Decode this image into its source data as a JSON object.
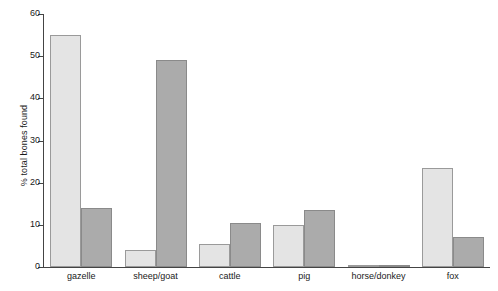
{
  "chart_data": {
    "type": "bar",
    "title": "",
    "xlabel": "",
    "ylabel": "% total bones found",
    "ylim": [
      0,
      60
    ],
    "yticks": [
      0,
      10,
      20,
      30,
      40,
      50,
      60
    ],
    "ytick_labels": [
      "0",
      "10",
      "20",
      "30",
      "40",
      "50",
      "60"
    ],
    "grid": false,
    "legend": "none",
    "categories": [
      "gazelle",
      "sheep/goat",
      "cattle",
      "pig",
      "horse/donkey",
      "fox"
    ],
    "series": [
      {
        "name": "light",
        "color": "#e4e4e4",
        "values": [
          55,
          4,
          5.5,
          10,
          0.5,
          23.5
        ]
      },
      {
        "name": "dark",
        "color": "#ababab",
        "values": [
          14,
          49,
          10.5,
          13.5,
          0.5,
          7
        ]
      }
    ]
  },
  "colors": {
    "background": "#ffffff",
    "axis": "#444444",
    "text": "#1a1a1a",
    "bar_light_fill": "#e4e4e4",
    "bar_light_edge": "#9a9a9a",
    "bar_dark_fill": "#ababab",
    "bar_dark_edge": "#8a8a8a"
  }
}
